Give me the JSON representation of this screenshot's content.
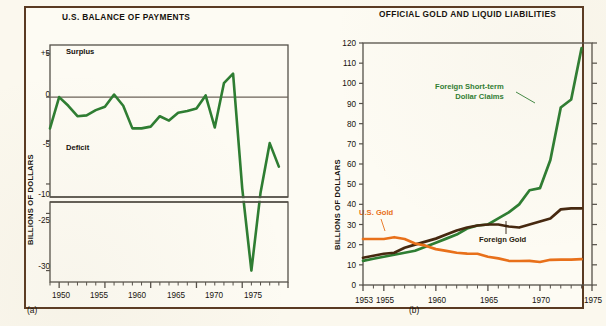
{
  "figure": {
    "background_color": "#fdfbf3",
    "border_color": "#5a3a22"
  },
  "colors": {
    "green": "#2e7d32",
    "orange": "#e8701a",
    "brown": "#46280f",
    "axis": "#555049",
    "text": "#15110c"
  },
  "panel_a": {
    "letter": "(a)",
    "title": "U.S. BALANCE OF PAYMENTS",
    "ylabel": "BILLIONS OF DOLLARS",
    "annotations": {
      "surplus": "Surplus",
      "deficit": "Deficit"
    },
    "ytick_labels": [
      "+5",
      "0",
      "-5",
      "-10",
      "-25",
      "-30"
    ],
    "xtick_labels": [
      "1950",
      "1955",
      "1960",
      "1965",
      "1970",
      "1975"
    ]
  },
  "panel_b": {
    "letter": "(b)",
    "title": "OFFICIAL GOLD AND LIQUID LIABILITIES",
    "ylabel": "BILLIONS OF DOLLARS",
    "series_labels": {
      "green_line1": "Foreign Short-term",
      "green_line2": "Dollar Claims",
      "orange": "U.S. Gold",
      "brown": "Foreign Gold"
    },
    "ytick_labels": [
      "0",
      "10",
      "20",
      "30",
      "40",
      "50",
      "60",
      "70",
      "80",
      "90",
      "100",
      "110",
      "120"
    ],
    "xtick_labels": [
      "1953",
      "1955",
      "1960",
      "1965",
      "1970",
      "1975"
    ]
  },
  "chart_data": [
    {
      "type": "line",
      "id": "panel-a",
      "title": "U.S. BALANCE OF PAYMENTS",
      "xlabel": "",
      "ylabel": "BILLIONS OF DOLLARS",
      "xlim": [
        1949,
        1975
      ],
      "ylim": [
        -31,
        6
      ],
      "yaxis_break": {
        "between": [
          -11.5,
          -24
        ],
        "upper_segment": [
          -11.5,
          6
        ],
        "lower_segment": [
          -31,
          -24
        ]
      },
      "grid": false,
      "legend": "none",
      "annotations": [
        {
          "text": "Surplus",
          "x": 1950.6,
          "y": 4.0
        },
        {
          "text": "Deficit",
          "x": 1950.6,
          "y": -5.6
        }
      ],
      "yticks": [
        5,
        0,
        -5,
        -10,
        -25,
        -30
      ],
      "ytick_labels": [
        "+5",
        "0",
        "-5",
        "-10",
        "-25",
        "-30"
      ],
      "xticks": [
        1950,
        1955,
        1960,
        1965,
        1970,
        1975
      ],
      "series": [
        {
          "name": "U.S. balance of payments",
          "color": "#2e7d32",
          "x": [
            1949,
            1950,
            1951,
            1952,
            1953,
            1954,
            1955,
            1956,
            1957,
            1958,
            1959,
            1960,
            1961,
            1962,
            1963,
            1964,
            1965,
            1966,
            1967,
            1968,
            1969,
            1970,
            1971,
            1972,
            1973,
            1974
          ],
          "values": [
            -3.6,
            0.0,
            -1.0,
            -2.2,
            -2.1,
            -1.5,
            -1.1,
            0.3,
            -1.0,
            -3.6,
            -3.6,
            -3.4,
            -2.2,
            -2.7,
            -1.8,
            -1.6,
            -1.3,
            0.2,
            -3.5,
            1.6,
            2.7,
            -10.5,
            -30.0,
            -11.0,
            -5.3,
            -8.0
          ]
        }
      ]
    },
    {
      "type": "line",
      "id": "panel-b",
      "title": "OFFICIAL GOLD AND LIQUID LIABILITIES",
      "xlabel": "",
      "ylabel": "BILLIONS OF DOLLARS",
      "xlim": [
        1953,
        1975
      ],
      "ylim": [
        0,
        120
      ],
      "grid": false,
      "legend": "inline-labels",
      "yticks": [
        0,
        10,
        20,
        30,
        40,
        50,
        60,
        70,
        80,
        90,
        100,
        110,
        120
      ],
      "xticks": [
        1953,
        1955,
        1960,
        1965,
        1970,
        1975
      ],
      "series": [
        {
          "name": "Foreign Short-term Dollar Claims",
          "color": "#2e7d32",
          "x": [
            1953,
            1954,
            1955,
            1956,
            1957,
            1958,
            1959,
            1960,
            1961,
            1962,
            1963,
            1964,
            1965,
            1966,
            1967,
            1968,
            1969,
            1970,
            1971,
            1972,
            1973,
            1974
          ],
          "values": [
            12,
            13,
            14,
            15,
            16,
            17,
            19,
            21,
            23,
            25,
            28,
            29.5,
            30,
            33,
            36,
            40,
            47,
            48,
            62,
            88,
            92,
            117.5
          ]
        },
        {
          "name": "Foreign Gold",
          "color": "#46280f",
          "x": [
            1953,
            1954,
            1955,
            1956,
            1957,
            1958,
            1959,
            1960,
            1961,
            1962,
            1963,
            1964,
            1965,
            1966,
            1967,
            1968,
            1969,
            1970,
            1971,
            1972,
            1973,
            1974
          ],
          "values": [
            13.5,
            14.5,
            15.5,
            16,
            18.5,
            20,
            21.5,
            23,
            25,
            27,
            28.5,
            29.5,
            30,
            30,
            29,
            28.5,
            30,
            31.5,
            33,
            37.5,
            38,
            38
          ]
        },
        {
          "name": "U.S. Gold",
          "color": "#e8701a",
          "x": [
            1953,
            1954,
            1955,
            1956,
            1957,
            1958,
            1959,
            1960,
            1961,
            1962,
            1963,
            1964,
            1965,
            1966,
            1967,
            1968,
            1969,
            1970,
            1971,
            1972,
            1973,
            1974
          ],
          "values": [
            22.8,
            22.8,
            22.8,
            23.7,
            22.8,
            20.6,
            19.5,
            17.8,
            16.9,
            16,
            15.6,
            15.5,
            14,
            13.2,
            12,
            11.9,
            12,
            11.4,
            12.5,
            12.6,
            12.6,
            12.8
          ]
        }
      ]
    }
  ]
}
